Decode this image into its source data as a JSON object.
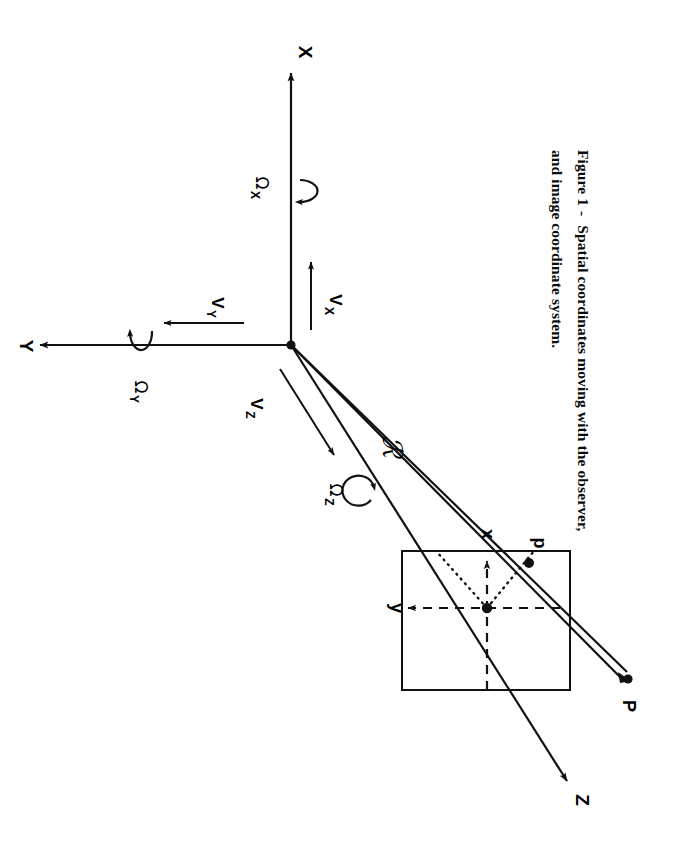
{
  "figure": {
    "caption_prefix": "Figure 1",
    "caption_dash": "-",
    "caption_line1": "Spatial coordinates moving with the observer,",
    "caption_line2": "and image coordinate system.",
    "caption_full": "Figure 1 - Spatial coordinates moving with the observer, and image coordinate system."
  },
  "colors": {
    "ink": "#111111",
    "paper": "#ffffff"
  },
  "spatial_axes": [
    {
      "name": "axis-x",
      "label": "X",
      "direction": "up"
    },
    {
      "name": "axis-y",
      "label": "Y",
      "direction": "left"
    },
    {
      "name": "axis-z",
      "label": "Z",
      "direction": "down-right"
    }
  ],
  "velocity_vectors": [
    {
      "name": "velocity-x",
      "symbol": "V",
      "subscript": "X",
      "label": "V X"
    },
    {
      "name": "velocity-y",
      "symbol": "V",
      "subscript": "Y",
      "label": "V Y"
    },
    {
      "name": "velocity-z",
      "symbol": "V",
      "subscript": "Z",
      "label": "V Z"
    }
  ],
  "angular_rates": [
    {
      "name": "omega-x",
      "symbol": "Ω",
      "subscript": "X",
      "label": "Ω X"
    },
    {
      "name": "omega-y",
      "symbol": "Ω",
      "subscript": "Y",
      "label": "Ω Y"
    },
    {
      "name": "omega-z",
      "symbol": "Ω",
      "subscript": "Z",
      "label": "Ω Z"
    }
  ],
  "ray": {
    "label": "ℛ",
    "label_plain": "R",
    "description": "range vector from origin to object point"
  },
  "image_plane": {
    "name": "image-plane-square",
    "axes": [
      {
        "name": "image-axis-x",
        "label": "x",
        "direction": "up"
      },
      {
        "name": "image-axis-y",
        "label": "y",
        "direction": "left"
      }
    ],
    "image_point": {
      "label": "p"
    }
  },
  "object_point": {
    "label": "P"
  }
}
